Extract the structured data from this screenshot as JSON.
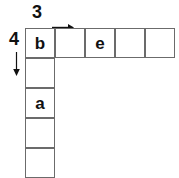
{
  "diagram": {
    "type": "l-shaped-grid",
    "shape_description": "L-shaped polyomino grid: one horizontal row of cells across the top and one vertical column of cells down the left side, sharing the top-left corner cell.",
    "labels": {
      "columns": {
        "value": "3",
        "icon": "arrow-right-icon",
        "direction": "right"
      },
      "rows": {
        "value": "4",
        "icon": "arrow-down-icon",
        "direction": "down"
      }
    },
    "geometry": {
      "cell_size": 30,
      "origin_x": 25,
      "origin_y": 28,
      "top_row_cells": 5,
      "left_column_cells": 5
    },
    "colors": {
      "cell_border": "#6b6b6b",
      "cell_fill": "#ffffff",
      "text": "#111111",
      "background": "#ffffff"
    },
    "top_row": [
      {
        "index": 0,
        "label": "b",
        "col": 0,
        "row": 0
      },
      {
        "index": 1,
        "label": "",
        "col": 1,
        "row": 0
      },
      {
        "index": 2,
        "label": "e",
        "col": 2,
        "row": 0
      },
      {
        "index": 3,
        "label": "",
        "col": 3,
        "row": 0
      },
      {
        "index": 4,
        "label": "",
        "col": 4,
        "row": 0
      }
    ],
    "left_column": [
      {
        "index": 0,
        "label": "",
        "col": 0,
        "row": 1
      },
      {
        "index": 1,
        "label": "a",
        "col": 0,
        "row": 2
      },
      {
        "index": 2,
        "label": "",
        "col": 0,
        "row": 3
      },
      {
        "index": 3,
        "label": "",
        "col": 0,
        "row": 4
      }
    ]
  }
}
